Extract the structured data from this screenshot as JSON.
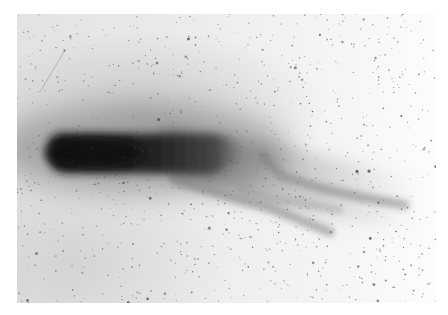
{
  "image": {
    "subject": "Comet photographed as a photographic negative",
    "description": "Dark comet head (coma) at left with a long tail extending to the right that splits into several streamers; speckled star field background",
    "colors": {
      "page_background": "#ffffff",
      "plate_background": "#e8e8e8",
      "coma": "#1c1c1c",
      "tail": "#5a5a5a",
      "streamers": "#7a7a7a",
      "stars": "#4a4a4a"
    },
    "plate_bounds": {
      "x": 17,
      "y": 14,
      "width": 419,
      "height": 289
    },
    "coma": {
      "cx": 48,
      "cy": 140,
      "length": 190,
      "half_height": 22
    },
    "streamers": [
      {
        "name": "upper-streamer",
        "points": [
          [
            262,
            156
          ],
          [
            282,
            176
          ],
          [
            320,
            188
          ],
          [
            360,
            197
          ],
          [
            405,
            205
          ]
        ]
      },
      {
        "name": "lower-streamer",
        "points": [
          [
            175,
            180
          ],
          [
            230,
            197
          ],
          [
            270,
            208
          ],
          [
            305,
            222
          ],
          [
            330,
            232
          ]
        ]
      },
      {
        "name": "middle-streamer",
        "points": [
          [
            240,
            190
          ],
          [
            270,
            199
          ],
          [
            300,
            203
          ],
          [
            340,
            210
          ]
        ]
      }
    ],
    "scratch": {
      "from": [
        40,
        92
      ],
      "to": [
        65,
        50
      ]
    },
    "starfield": {
      "seed": 7,
      "count": 900
    }
  }
}
